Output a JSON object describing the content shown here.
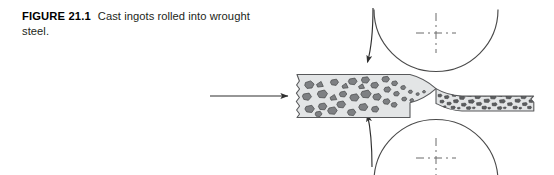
{
  "figure": {
    "label": "FIGURE 21.1",
    "caption": "Cast ingots rolled into wrought steel."
  },
  "diagram": {
    "type": "rolling-mill-schematic",
    "title": "Cast ingots rolled into wrought steel",
    "background": "#ffffff",
    "stroke_color": "#3a3a3a",
    "workpiece": {
      "fill": "#e3e5e6",
      "stroke": "#58595b",
      "entry_label": "cast ingot slab",
      "exit_label": "wrought steel sheet",
      "entry_thickness_px": 44,
      "exit_thickness_px": 15,
      "entry_left_x": 296,
      "exit_right_x": 534,
      "centerline_y": 96
    },
    "grains": {
      "fill": "#7e8083",
      "stroke": "#4b4c4e",
      "entry_description": "large coarse equiaxed grains",
      "exit_description": "small elongated flattened grains",
      "entry_count": 34,
      "exit_count": 62
    },
    "rolls": [
      {
        "name": "top-roll",
        "center_x": 436,
        "center_y": 33,
        "radius": 62,
        "rotation": "clockwise",
        "center_mark": "dashed-crosshair"
      },
      {
        "name": "bottom-roll",
        "center_x": 436,
        "center_y": 158,
        "radius": 62,
        "rotation": "counter-clockwise",
        "center_mark": "dashed-crosshair"
      }
    ],
    "arrows": [
      {
        "name": "feed-direction-arrow",
        "kind": "straight",
        "direction": "right",
        "x1": 210,
        "y1": 96,
        "x2": 288,
        "y2": 96
      },
      {
        "name": "top-roll-rotation-arrow",
        "kind": "curved",
        "direction": "down"
      },
      {
        "name": "bottom-roll-rotation-arrow",
        "kind": "curved",
        "direction": "up"
      }
    ]
  }
}
